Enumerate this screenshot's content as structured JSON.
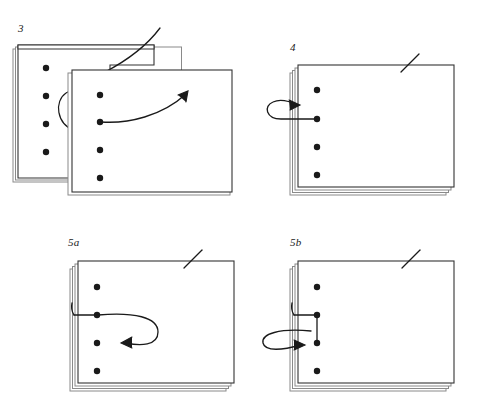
{
  "figure": {
    "width": 478,
    "height": 407,
    "background_color": "#ffffff",
    "ink_color": "#1a1a1a",
    "sheet_fill": "#ffffff",
    "sheet_edge_color": "#3a3a3a",
    "sheet_shadow_color": "#8a8a8a",
    "hole_color": "#1a1a1a",
    "thread_color": "#1a1a1a"
  },
  "panels": [
    {
      "id": "panel-3",
      "label": "3",
      "label_x": 18,
      "label_y": 24,
      "holes_count": 4,
      "sheets_back": 2,
      "sheets_front": 1,
      "description": "Two opened sheets side by side; thread passes over the fold and a curved arrow points up-right from the second hole of the front sheet.",
      "arrow_direction": "up-right"
    },
    {
      "id": "panel-4",
      "label": "4",
      "label_x": 290,
      "label_y": 43,
      "holes_count": 4,
      "sheets_back": 3,
      "sheets_front": 1,
      "description": "Stack of folded sheets; thread exits the second hole, loops left around the spine and the arrow points back into the spine.",
      "arrow_direction": "right-into-spine"
    },
    {
      "id": "panel-5a",
      "label": "5a",
      "label_x": 68,
      "label_y": 238,
      "holes_count": 4,
      "sheets_back": 3,
      "sheets_front": 1,
      "description": "Thread comes out of the spine into the second hole, loops out to the right and the arrow points back left toward the third hole.",
      "arrow_direction": "left-toward-third-hole"
    },
    {
      "id": "panel-5b",
      "label": "5b",
      "label_x": 290,
      "label_y": 238,
      "holes_count": 4,
      "sheets_back": 3,
      "sheets_front": 1,
      "description": "Thread runs from the second hole down to the third hole, out through the spine, loops left and the arrow points back right into the third hole.",
      "arrow_direction": "right-into-third-hole"
    }
  ]
}
